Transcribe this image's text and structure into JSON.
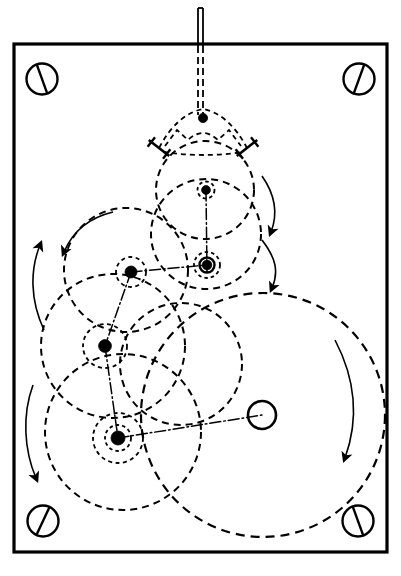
{
  "figure": {
    "type": "mechanical-engineering-line-drawing",
    "background_color": "#ffffff",
    "ink_color": "#000000",
    "canvas": {
      "width": 401,
      "height": 576
    }
  },
  "frame": {
    "name": "mounting-plate",
    "x": 14,
    "y": 44,
    "width": 373,
    "height": 508,
    "stroke_width": 3.2,
    "stroke_color": "#000000",
    "fill": "none"
  },
  "screws": [
    {
      "id": "screw-top-left",
      "label": "top-left mounting screw",
      "cx": 42,
      "cy": 79,
      "r": 15.5,
      "slot_angle_deg": 70
    },
    {
      "id": "screw-top-right",
      "label": "top-right mounting screw",
      "cx": 359,
      "cy": 79,
      "r": 15.5,
      "slot_angle_deg": 110
    },
    {
      "id": "screw-bottom-left",
      "label": "bottom-left mounting screw",
      "cx": 43,
      "cy": 521,
      "r": 15.5,
      "slot_angle_deg": 115
    },
    {
      "id": "screw-bottom-right",
      "label": "bottom-right mounting screw",
      "cx": 358,
      "cy": 521,
      "r": 15.5,
      "slot_angle_deg": 70
    }
  ],
  "input_shaft": {
    "name": "input-shaft",
    "solid": {
      "x1": 200.5,
      "y1": 8,
      "x2": 200.5,
      "y2": 46,
      "width": 5.0
    },
    "dashed": {
      "x1": 200.5,
      "y1": 46,
      "x2": 200.5,
      "y2": 115,
      "width": 5.0,
      "dash": "7,4"
    }
  },
  "yoke": {
    "name": "gripper-yoke",
    "apex": {
      "x": 203,
      "y": 118
    },
    "apex_dot_r": 4.6,
    "left_arm_end": {
      "x": 159,
      "y": 148
    },
    "right_arm_end": {
      "x": 247,
      "y": 148
    },
    "jaw_half_len": 13,
    "description": "triangular yoke with two angled clamp jaws"
  },
  "circles": [
    {
      "id": "circle-yoke-path",
      "cx": 205,
      "cy": 190,
      "r": 49,
      "dash": "7,5",
      "stroke_width": 2.0
    },
    {
      "id": "circle-hub-upper-small",
      "cx": 206,
      "cy": 190,
      "r": 8.5,
      "dash": "3.5,3",
      "stroke_width": 1.8
    },
    {
      "id": "circle-mid-right-large",
      "cx": 206,
      "cy": 234,
      "r": 55,
      "dash": "7,5",
      "stroke_width": 2.0
    },
    {
      "id": "circle-bearing-outer-dashed",
      "cx": 207,
      "cy": 265,
      "r": 13,
      "dash": "3.5,3",
      "stroke_width": 1.8
    },
    {
      "id": "circle-bearing-ring",
      "cx": 207,
      "cy": 265,
      "r": 7.5,
      "stroke_width": 2.4
    },
    {
      "id": "circle-upper-left-large",
      "cx": 126,
      "cy": 270,
      "r": 62,
      "dash": "7,5",
      "stroke_width": 2.0
    },
    {
      "id": "circle-pivot-b-small",
      "cx": 131,
      "cy": 272,
      "r": 15,
      "dash": "4,3.5",
      "stroke_width": 1.8
    },
    {
      "id": "circle-mid-left-large",
      "cx": 113,
      "cy": 346,
      "r": 72,
      "dash": "7,5",
      "stroke_width": 2.0
    },
    {
      "id": "circle-pivot-c-small",
      "cx": 105,
      "cy": 346,
      "r": 22,
      "dash": "4,3.5",
      "stroke_width": 1.8
    },
    {
      "id": "circle-lower-left-large",
      "cx": 123,
      "cy": 432,
      "r": 78,
      "dash": "7,5",
      "stroke_width": 2.0
    },
    {
      "id": "circle-pivot-d-small",
      "cx": 118,
      "cy": 438,
      "r": 25,
      "dash": "4,3.5",
      "stroke_width": 1.8
    },
    {
      "id": "circle-pivot-d-inner",
      "cx": 118,
      "cy": 438,
      "r": 13,
      "dash": "3.5,3",
      "stroke_width": 1.8
    },
    {
      "id": "circle-output-large",
      "cx": 263,
      "cy": 415,
      "r": 122,
      "dash": "9,6",
      "stroke_width": 2.2
    },
    {
      "id": "circle-mid-crank",
      "cx": 181,
      "cy": 364,
      "r": 61,
      "dash": "7,5",
      "stroke_width": 2.0
    }
  ],
  "pivots": [
    {
      "id": "pivot-yoke-apex",
      "label": "yoke apex pin",
      "cx": 203,
      "cy": 118,
      "r": 4.6,
      "filled": true
    },
    {
      "id": "pivot-hub-upper",
      "label": "upper hub pin",
      "cx": 206,
      "cy": 190,
      "r": 4.4,
      "filled": true
    },
    {
      "id": "pivot-bearing-main",
      "label": "main bearing pivot",
      "cx": 207,
      "cy": 265,
      "r": 4.8,
      "filled": true
    },
    {
      "id": "pivot-b",
      "label": "link pivot B",
      "cx": 131,
      "cy": 272,
      "r": 6.0,
      "filled": true
    },
    {
      "id": "pivot-c",
      "label": "link pivot C",
      "cx": 105,
      "cy": 346,
      "r": 6.4,
      "filled": true
    },
    {
      "id": "pivot-d",
      "label": "link pivot D",
      "cx": 118,
      "cy": 438,
      "r": 7.0,
      "filled": true
    },
    {
      "id": "pivot-output-open",
      "label": "output crank pin (open)",
      "cx": 262,
      "cy": 415,
      "r": 14,
      "filled": false,
      "stroke_width": 2.6
    }
  ],
  "links": [
    {
      "id": "link-b-to-bearing",
      "label": "link pivot B to main bearing",
      "x1": 131,
      "y1": 272,
      "x2": 207,
      "y2": 265,
      "style": "dash-dot"
    },
    {
      "id": "link-b-to-c",
      "label": "link pivot B to pivot C",
      "x1": 131,
      "y1": 272,
      "x2": 105,
      "y2": 346,
      "style": "dash-dot"
    },
    {
      "id": "link-c-to-d",
      "label": "link pivot C to pivot D",
      "x1": 105,
      "y1": 346,
      "x2": 118,
      "y2": 438,
      "style": "dash-dot"
    },
    {
      "id": "link-d-to-output",
      "label": "link pivot D to output crank pin",
      "x1": 118,
      "y1": 438,
      "x2": 262,
      "y2": 415,
      "style": "dash-dot"
    },
    {
      "id": "link-hub-to-bearing",
      "label": "upper hub to main bearing centreline",
      "x1": 206,
      "y1": 190,
      "x2": 207,
      "y2": 272,
      "style": "dash-dot"
    }
  ],
  "motion_arrows": [
    {
      "id": "arrow-left-upper",
      "label": "counter-clockwise motion arrow upper left",
      "sweep": "ccw",
      "direction": "up",
      "path": "M 44 330 C 30 300 30 270 40 245",
      "head_at": "start-end-up"
    },
    {
      "id": "arrow-left-lower",
      "label": "clockwise motion arrow lower left",
      "sweep": "cw",
      "direction": "down",
      "path": "M 33 385 C 22 415 24 450 36 478",
      "head_at": "end-down"
    },
    {
      "id": "arrow-upper-left-big",
      "label": "counter-clockwise arrow on upper-left circle",
      "sweep": "ccw",
      "direction": "down-left",
      "path": "M 113 212 C 88 218 72 233 64 252",
      "head_at": "end"
    },
    {
      "id": "arrow-right-upper",
      "label": "clockwise arrow upper right",
      "sweep": "cw",
      "direction": "down",
      "path": "M 262 176 C 276 196 278 214 271 232",
      "head_at": "end-down"
    },
    {
      "id": "arrow-right-mid",
      "label": "clockwise arrow mid right",
      "sweep": "cw",
      "direction": "down",
      "path": "M 262 240 C 276 258 279 272 272 288",
      "head_at": "end-down"
    },
    {
      "id": "arrow-right-outer",
      "label": "clockwise arrow on large output circle",
      "sweep": "cw",
      "direction": "down",
      "path": "M 335 340 C 357 382 358 422 345 458",
      "head_at": "end-down"
    }
  ],
  "legend": {
    "dashed_meaning": "moving link / path of motion (phantom line)",
    "dash_dot_meaning": "link centreline",
    "solid_meaning": "fixed frame and input shaft",
    "filled_dot_meaning": "revolute joint (pin)",
    "open_circle_meaning": "free crank pin"
  }
}
